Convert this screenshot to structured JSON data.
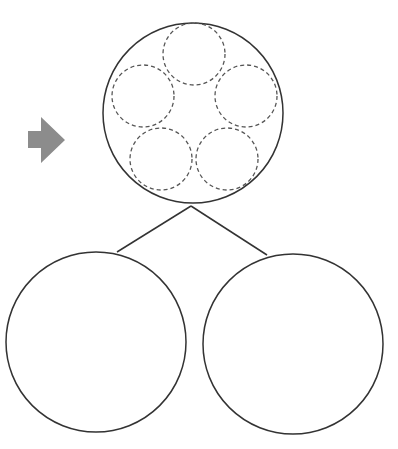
{
  "diagram": {
    "colors": {
      "stroke": "#333333",
      "dashed_stroke": "#555555",
      "arrow_fill": "#8c8c8c",
      "background": "#ffffff"
    },
    "arrow": {
      "icon": "right-arrow-icon"
    },
    "parent_circle": {
      "cx": 193,
      "cy": 113,
      "r": 90,
      "inner_dashed_circles": [
        {
          "cx": 194,
          "cy": 54,
          "r": 31
        },
        {
          "cx": 143,
          "cy": 96,
          "r": 31
        },
        {
          "cx": 246,
          "cy": 96,
          "r": 31
        },
        {
          "cx": 161,
          "cy": 159,
          "r": 31
        },
        {
          "cx": 227,
          "cy": 159,
          "r": 31
        }
      ]
    },
    "child_circles": [
      {
        "cx": 96,
        "cy": 342,
        "r": 90
      },
      {
        "cx": 293,
        "cy": 344,
        "r": 90
      }
    ],
    "connectors": [
      {
        "x1": 191,
        "y1": 206,
        "x2": 117,
        "y2": 252
      },
      {
        "x1": 191,
        "y1": 206,
        "x2": 267,
        "y2": 255
      }
    ]
  }
}
